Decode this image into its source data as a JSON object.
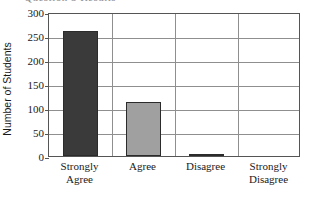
{
  "title_fragment": "Question 5 Results",
  "axes": {
    "y_title": "Number of Students",
    "y_ticks": [
      300,
      250,
      200,
      150,
      100,
      50,
      0
    ],
    "y_min": 0,
    "y_max": 300
  },
  "chart_data": {
    "type": "bar",
    "title": "Question 5 Results",
    "xlabel": "",
    "ylabel": "Number of Students",
    "ylim": [
      0,
      300
    ],
    "ytick_interval": 50,
    "yticks": [
      0,
      50,
      100,
      150,
      200,
      250,
      300
    ],
    "grid": "horizontal",
    "legend": "none",
    "categories": [
      "Strongly Agree",
      "Agree",
      "Disagree",
      "Strongly Disagree"
    ],
    "category_lines": [
      [
        "Strongly",
        "Agree"
      ],
      [
        "Agree",
        ""
      ],
      [
        "Disagree",
        ""
      ],
      [
        "Strongly",
        "Disagree"
      ]
    ],
    "values": [
      260,
      112,
      4,
      0
    ],
    "bar_colors": [
      "#3a3a3a",
      "#a0a0a0",
      "#3a3a3a",
      "#a0a0a0"
    ],
    "bar_border_color": "#2b2b2b"
  },
  "colors": {
    "bar_dark": "#3a3a3a",
    "bar_light": "#a0a0a0",
    "axis": "#555555",
    "gridline": "#8f8f8f",
    "text": "#1a1a1a",
    "background": "#ffffff"
  }
}
